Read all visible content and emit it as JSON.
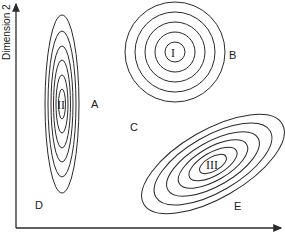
{
  "figure": {
    "y_axis_label": "Dimension 2",
    "x_axis_label": "",
    "clusters": [
      {
        "id": "I",
        "label": "I",
        "shape": "circular",
        "center": [
          175,
          52
        ],
        "rings": [
          [
            50,
            50
          ],
          [
            40,
            40
          ],
          [
            30,
            30
          ],
          [
            20,
            20
          ],
          [
            10,
            10
          ]
        ],
        "rotation": 0
      },
      {
        "id": "II",
        "label": "II",
        "shape": "vertical-ellipse",
        "center": [
          62,
          104
        ],
        "rings": [
          [
            17,
            89
          ],
          [
            14,
            73
          ],
          [
            11,
            58
          ],
          [
            8.5,
            44
          ],
          [
            6,
            29
          ],
          [
            3.5,
            15
          ]
        ],
        "rotation": 0
      },
      {
        "id": "III",
        "label": "III",
        "shape": "oblique-ellipse",
        "center": [
          213,
          164
        ],
        "rings": [
          [
            80,
            34
          ],
          [
            66,
            28
          ],
          [
            52,
            22
          ],
          [
            39,
            16.5
          ],
          [
            27,
            11.5
          ],
          [
            15,
            7
          ]
        ],
        "rotation": -30
      }
    ],
    "region_labels": [
      {
        "text": "A",
        "x": 91,
        "y": 108
      },
      {
        "text": "B",
        "x": 229,
        "y": 59
      },
      {
        "text": "C",
        "x": 130,
        "y": 131
      },
      {
        "text": "D",
        "x": 35,
        "y": 209
      },
      {
        "text": "E",
        "x": 234,
        "y": 210
      }
    ],
    "colors": {
      "line": "#2a2a2a",
      "background": "#ffffff"
    }
  }
}
